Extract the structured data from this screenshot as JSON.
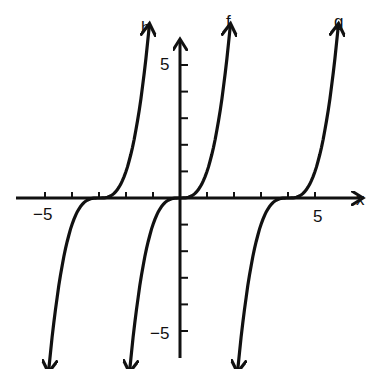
{
  "chart_data": {
    "type": "line",
    "title": "",
    "xlabel": "x",
    "ylabel": "",
    "xlim": [
      -6,
      6.5
    ],
    "ylim": [
      -6,
      6
    ],
    "grid": false,
    "x_ticks": [
      -5,
      -4,
      -3,
      -2,
      -1,
      1,
      2,
      3,
      4,
      5
    ],
    "y_ticks": [
      -5,
      -4,
      -3,
      -2,
      -1,
      1,
      2,
      3,
      4,
      5
    ],
    "tick_labels": {
      "x": [
        "-5",
        "5"
      ],
      "y": [
        "5",
        "-5"
      ]
    },
    "series": [
      {
        "name": "h",
        "formula": "(x+3)^3",
        "x": [
          -4.85,
          -4.5,
          -4,
          -3.5,
          -3,
          -2.5,
          -2,
          -1.5,
          -1.15
        ],
        "y": [
          -6.3,
          -3.4,
          -1,
          -0.125,
          0,
          0.125,
          1,
          3.4,
          6.3
        ]
      },
      {
        "name": "f",
        "formula": "x^3",
        "x": [
          -1.85,
          -1.5,
          -1,
          -0.5,
          0,
          0.5,
          1,
          1.5,
          1.85
        ],
        "y": [
          -6.3,
          -3.4,
          -1,
          -0.125,
          0,
          0.125,
          1,
          3.4,
          6.3
        ]
      },
      {
        "name": "g",
        "formula": "(x-4)^3",
        "x": [
          2.15,
          2.5,
          3,
          3.5,
          4,
          4.5,
          5,
          5.5,
          5.85
        ],
        "y": [
          -6.3,
          -3.4,
          -1,
          -0.125,
          0,
          0.125,
          1,
          3.4,
          6.3
        ]
      }
    ],
    "legend": [
      "h",
      "f",
      "g"
    ]
  },
  "labels": {
    "x_axis": "x",
    "x_neg": "−5",
    "x_pos": "5",
    "y_pos": "5",
    "y_neg": "−5",
    "h": "h",
    "f": "f",
    "g": "g"
  }
}
